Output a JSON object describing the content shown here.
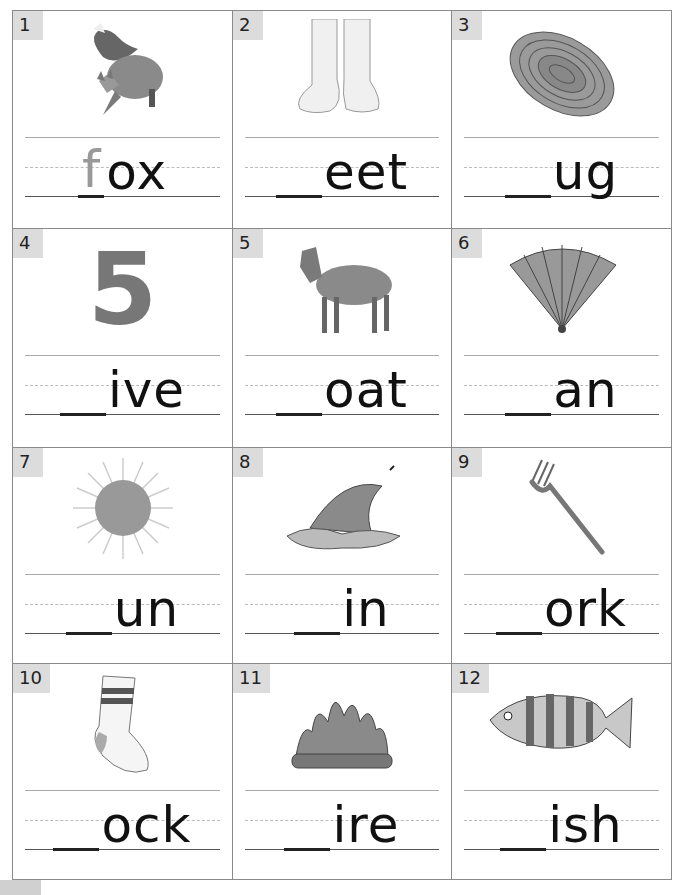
{
  "worksheet": {
    "cells": [
      {
        "number": "1",
        "picture": "fox",
        "filled_letter": "f",
        "word_ending": "ox"
      },
      {
        "number": "2",
        "picture": "feet",
        "filled_letter": "",
        "word_ending": "eet"
      },
      {
        "number": "3",
        "picture": "rug",
        "filled_letter": "",
        "word_ending": "ug"
      },
      {
        "number": "4",
        "picture": "number-five",
        "picture_text": "5",
        "filled_letter": "",
        "word_ending": "ive"
      },
      {
        "number": "5",
        "picture": "goat",
        "filled_letter": "",
        "word_ending": "oat"
      },
      {
        "number": "6",
        "picture": "fan",
        "filled_letter": "",
        "word_ending": "an"
      },
      {
        "number": "7",
        "picture": "sun",
        "filled_letter": "",
        "word_ending": "un"
      },
      {
        "number": "8",
        "picture": "shark-fin",
        "filled_letter": "",
        "word_ending": "in"
      },
      {
        "number": "9",
        "picture": "fork",
        "filled_letter": "",
        "word_ending": "ork"
      },
      {
        "number": "10",
        "picture": "sock",
        "filled_letter": "",
        "word_ending": "ock"
      },
      {
        "number": "11",
        "picture": "fire",
        "filled_letter": "",
        "word_ending": "ire"
      },
      {
        "number": "12",
        "picture": "fish",
        "filled_letter": "",
        "word_ending": "ish"
      }
    ]
  }
}
